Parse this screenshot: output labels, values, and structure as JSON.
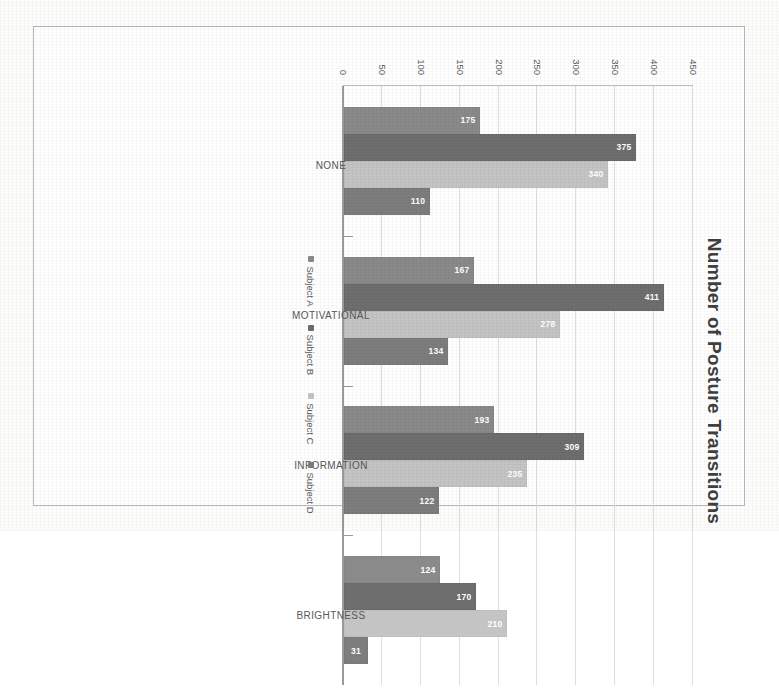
{
  "chart_data": {
    "type": "bar",
    "title": "Number of Posture Transitions",
    "xlabel": "",
    "ylabel": "Number of Posture Transitions",
    "categories": [
      "NONE",
      "MOTIVATIONAL",
      "INFORMATION",
      "BRIGHTNESS"
    ],
    "series": [
      {
        "name": "Subject A",
        "color": "#8a8a8a",
        "values": [
          175,
          167,
          193,
          124
        ]
      },
      {
        "name": "Subject B",
        "color": "#6e6e6e",
        "values": [
          375,
          411,
          309,
          170
        ]
      },
      {
        "name": "Subject C",
        "color": "#c4c4c4",
        "values": [
          340,
          278,
          235,
          210
        ]
      },
      {
        "name": "Subject D",
        "color": "#7d7d7d",
        "values": [
          110,
          134,
          122,
          31
        ]
      }
    ],
    "yticks": [
      0,
      50,
      100,
      150,
      200,
      250,
      300,
      350,
      400,
      450
    ],
    "ylim": [
      0,
      450
    ],
    "grid": true,
    "legend_position": "bottom",
    "axis_side": "right",
    "orientation": "rotated-90"
  },
  "figure": {
    "border_color": "#b9b9b9",
    "background": "#ffffff",
    "gridline_color": "#dedede",
    "axis_color": "#9a9a9a",
    "label_color": "#5a5a5a",
    "value_label_color": "#ffffff"
  }
}
